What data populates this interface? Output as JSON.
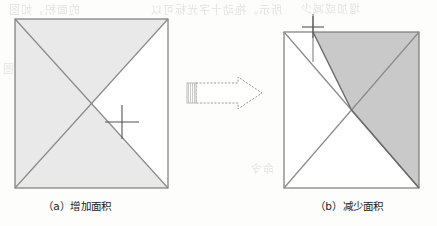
{
  "page": {
    "background_color": "#fdfdfc",
    "bleed_through_text": [
      "的面积，如图",
      "所示。拖动十字光标可以",
      "增加或减少",
      "绘图",
      "命令"
    ]
  },
  "figures": [
    {
      "id": "figure-a",
      "caption": "（a）增加面积",
      "square": {
        "x": 15,
        "y": 19,
        "width": 153,
        "height": 169
      },
      "center": {
        "x": 91.5,
        "y": 103.5
      },
      "fill_color": "#e9e9e9",
      "outline_color": "#6f6f6f",
      "diagonal_color": "#8a8a8a",
      "unfilled_region": "right-triangle",
      "cursor": {
        "type": "crosshair",
        "x": 122,
        "y": 122,
        "arm": 17
      }
    },
    {
      "id": "figure-b",
      "caption": "（b）减少面积",
      "square": {
        "x": 284,
        "y": 32,
        "width": 135,
        "height": 156
      },
      "center": {
        "x": 351.5,
        "y": 110
      },
      "fill_color": "#c9c9c9",
      "outline_color": "#6f6f6f",
      "diagonal_color": "#8a8a8a",
      "shaded_region": "top-right-polygon",
      "split_x": 313,
      "cursor": {
        "type": "crosshair",
        "x": 313,
        "y": 27,
        "arm": 11
      },
      "tracking_line": {
        "x": 313,
        "y1": 14,
        "y2": 62
      }
    }
  ],
  "arrow": {
    "name": "transition-arrow",
    "direction": "right",
    "style": "dashed-outline",
    "x": 186,
    "y": 77,
    "width": 76,
    "height": 32,
    "stroke_color": "#9a9a9a",
    "hatch_color": "#b5b5b5"
  }
}
